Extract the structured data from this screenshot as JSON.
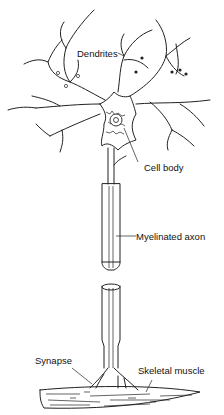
{
  "diagram": {
    "labels": {
      "dendrites": "Dendrites",
      "cell_body": "Cell body",
      "axon": "Myelinated axon",
      "synapse": "Synapse",
      "muscle": "Skeletal muscle"
    },
    "colors": {
      "line": "#222222",
      "background": "#ffffff"
    }
  }
}
